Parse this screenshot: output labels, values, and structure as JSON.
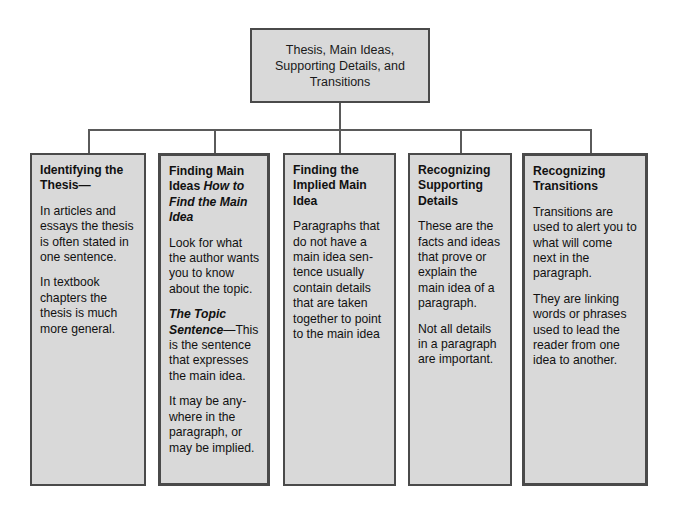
{
  "diagram": {
    "type": "hierarchy-tree",
    "title_box": {
      "text": "Thesis, Main Ideas,\nSupporting Details, and\nTransitions"
    },
    "branches": [
      {
        "id": "identifying-the-thesis",
        "heading": "Identifying the Thesis—",
        "heading_style": "bold",
        "paragraphs": [
          "In articles and essays the thesis is often stated in one sentence.",
          "In textbook chapters the thesis is much more general."
        ]
      },
      {
        "id": "finding-main-ideas",
        "heading": "Finding Main Ideas ",
        "heading_italic": "How to Find the Main Idea",
        "heading_style": "bold + bold-italic",
        "paragraphs": [
          "Look for what the author wants you to know about the topic."
        ],
        "subheading_italic": "The Topic Sentence",
        "subheading_rest": "—This is the sentence that expresses the main idea.",
        "paragraphs_after": [
          "It may be any-where in the paragraph, or may be implied."
        ]
      },
      {
        "id": "finding-the-implied-main-idea",
        "heading": "Finding the Implied Main Idea",
        "heading_style": "bold",
        "paragraphs": [
          "Paragraphs that do not have a main idea sen-tence usually contain details that are taken together to point to the main idea"
        ]
      },
      {
        "id": "recognizing-supporting-details",
        "heading": "Recognizing Supporting Details",
        "heading_style": "bold",
        "paragraphs": [
          "These are the facts and ideas that prove or explain the main idea of a paragraph.",
          "Not all details in a paragraph are important."
        ]
      },
      {
        "id": "recognizing-transitions",
        "heading": "Recognizing Transitions",
        "heading_style": "bold",
        "paragraphs": [
          "Transitions are used to alert you to what will come next in the paragraph.",
          "They are linking words or phrases used to lead the reader from one idea to another."
        ]
      }
    ],
    "colors": {
      "box_fill": "#d9d9d9",
      "box_border": "#4a4a4a",
      "connector": "#5a5a5a",
      "text": "#111111",
      "page_background": "#ffffff"
    }
  }
}
